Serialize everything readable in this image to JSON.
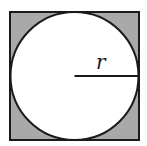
{
  "diagram": {
    "radius_label": "r",
    "colors": {
      "square_fill": "#a9a9a9",
      "circle_fill": "#ffffff",
      "stroke": "#1a1a1a"
    }
  }
}
